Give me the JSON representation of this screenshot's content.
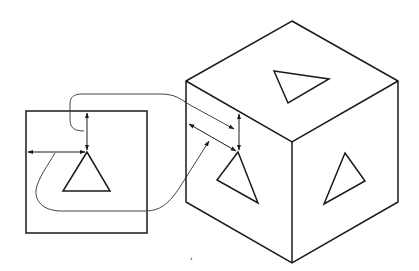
{
  "diagram": {
    "colors": {
      "background": "#ffffff",
      "ink": "#1a1a1a",
      "leader": "#444444"
    },
    "panel": {
      "rect": {
        "x": 26,
        "y": 111,
        "w": 121,
        "h": 122
      },
      "triangle": [
        [
          87,
          152
        ],
        [
          63,
          191
        ],
        [
          110,
          191
        ]
      ],
      "horizontal_dimension": {
        "x1": 27,
        "x2": 86,
        "y": 152
      },
      "vertical_dimension": {
        "x": 87,
        "y1": 112,
        "y2": 151
      }
    },
    "cube": {
      "vertices": {
        "top": [
          292,
          21
        ],
        "left_top": [
          186,
          81
        ],
        "right_top": [
          398,
          81
        ],
        "center": [
          292,
          142
        ],
        "left_bottom": [
          186,
          202
        ],
        "right_bottom": [
          398,
          202
        ],
        "bottom": [
          292,
          263
        ]
      },
      "top_face_triangle": [
        [
          274,
          71
        ],
        [
          329,
          79
        ],
        [
          288,
          103
        ]
      ],
      "left_face_triangle": [
        [
          238,
          152
        ],
        [
          217,
          180
        ],
        [
          258,
          203
        ]
      ],
      "right_face_triangle": [
        [
          345,
          153
        ],
        [
          365,
          181
        ],
        [
          324,
          204
        ]
      ],
      "vertical_dimension": {
        "x": 239,
        "y1": 113,
        "y2": 152
      },
      "slanted_dimension": {
        "x1": 188,
        "y1": 123,
        "x2": 237,
        "y2": 151
      }
    },
    "annotations": {
      "stray_mark": ","
    }
  }
}
